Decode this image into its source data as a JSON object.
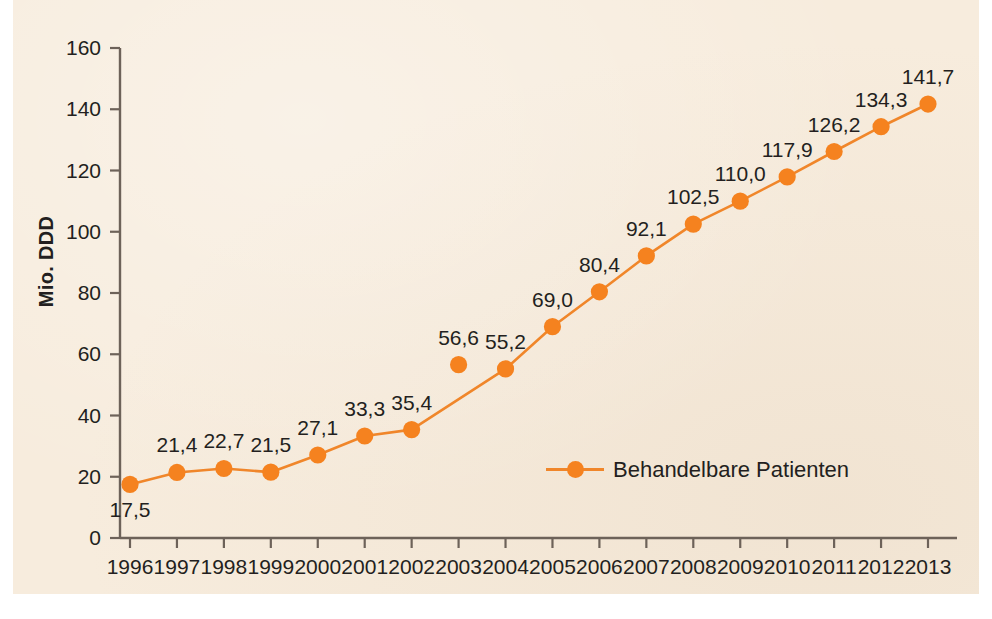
{
  "chart_data": {
    "type": "line",
    "title": "",
    "xlabel": "",
    "ylabel": "Mio. DDD",
    "ylim": [
      0,
      160
    ],
    "ytick_step": 20,
    "yticks": [
      "0",
      "20",
      "40",
      "60",
      "80",
      "100",
      "120",
      "140",
      "160"
    ],
    "grid": false,
    "legend_position": "inside-bottom-center",
    "categories": [
      "1996",
      "1997",
      "1998",
      "1999",
      "2000",
      "2001",
      "2002",
      "2003",
      "2004",
      "2005",
      "2006",
      "2007",
      "2008",
      "2009",
      "2010",
      "2011",
      "2012",
      "2013"
    ],
    "series": [
      {
        "name": "Behandelbare Patienten",
        "color": "#f5821f",
        "values": [
          17.5,
          21.4,
          22.7,
          21.5,
          27.1,
          33.3,
          35.4,
          56.6,
          55.2,
          69.0,
          80.4,
          92.1,
          102.5,
          110.0,
          117.9,
          126.2,
          134.3,
          141.7
        ],
        "value_labels": [
          "17,5",
          "21,4",
          "22,7",
          "21,5",
          "27,1",
          "33,3",
          "35,4",
          "56,6",
          "55,2",
          "69,0",
          "80,4",
          "92,1",
          "102,5",
          "110,0",
          "117,9",
          "126,2",
          "134,3",
          "141,7"
        ],
        "label_positions": [
          "below",
          "above",
          "above",
          "above",
          "above",
          "above",
          "above",
          "above",
          "above",
          "above",
          "above",
          "above",
          "above",
          "above",
          "above",
          "above",
          "above",
          "above"
        ],
        "detached_points": [
          7
        ]
      }
    ]
  },
  "legend": {
    "items": [
      {
        "label": "Behandelbare Patienten",
        "color": "#f5821f"
      }
    ]
  },
  "colors": {
    "series": "#f5821f",
    "line": "#f0862a",
    "axis": "#6d6259",
    "text": "#231f20",
    "background": "#f7ecdd",
    "page": "#ffffff"
  }
}
